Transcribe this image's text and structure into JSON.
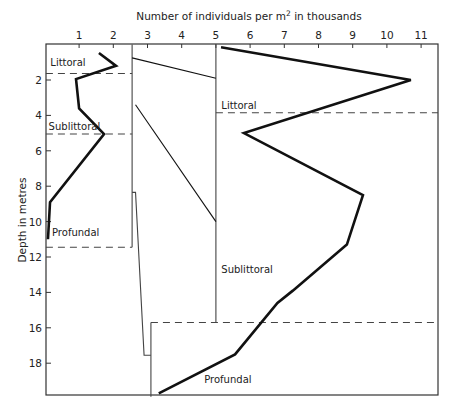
{
  "chart_data": {
    "type": "line",
    "title": "",
    "xlabel": "Number of individuals per m² in thousands",
    "xlabel_parts": {
      "before": "Number of individuals per m",
      "sup": "2",
      "after": " in thousands"
    },
    "ylabel": "Depth in metres",
    "x_ticks": [
      1,
      2,
      3,
      4,
      5,
      6,
      7,
      8,
      9,
      10,
      11
    ],
    "y_ticks": [
      2,
      4,
      6,
      8,
      10,
      12,
      14,
      16,
      18
    ],
    "xlim": [
      0,
      11.5
    ],
    "ylim": [
      0,
      19.9
    ],
    "y_inverted": true,
    "x_axis_position": "top",
    "grid": false,
    "series": [
      {
        "name": "Lake A",
        "style": "thick",
        "points": [
          [
            1.58,
            0.47
          ],
          [
            2.08,
            1.2
          ],
          [
            0.91,
            1.95
          ],
          [
            1.0,
            3.6
          ],
          [
            1.73,
            5.05
          ],
          [
            0.15,
            8.9
          ],
          [
            0.09,
            11.0
          ]
        ]
      },
      {
        "name": "Lake B",
        "style": "thick",
        "points": [
          [
            5.15,
            0.15
          ],
          [
            10.7,
            2.0
          ],
          [
            5.82,
            5.0
          ],
          [
            9.3,
            8.5
          ],
          [
            8.83,
            11.3
          ],
          [
            7.25,
            13.9
          ],
          [
            6.8,
            14.6
          ],
          [
            5.56,
            17.5
          ],
          [
            3.33,
            19.7
          ]
        ]
      },
      {
        "name": "Connector littoral",
        "style": "thin",
        "points": [
          [
            2.55,
            0.75
          ],
          [
            5.0,
            1.9
          ]
        ]
      },
      {
        "name": "Connector sublittoral",
        "style": "thin",
        "points": [
          [
            2.65,
            3.4
          ],
          [
            5.0,
            10.0
          ]
        ]
      }
    ],
    "zone_boundaries": [
      {
        "panel": "left",
        "depth": 1.63,
        "x_from": 0,
        "x_to": 2.55
      },
      {
        "panel": "left",
        "depth": 5.05,
        "x_from": 0,
        "x_to": 2.55
      },
      {
        "panel": "left",
        "depth": 11.45,
        "x_from": 0,
        "x_to": 2.55
      },
      {
        "panel": "right",
        "depth": 3.85,
        "x_from": 5.0,
        "x_to": 11.5
      },
      {
        "panel": "right",
        "depth": 15.7,
        "x_from": 3.1,
        "x_to": 11.5
      }
    ],
    "panel_lines": [
      {
        "name": "left-panel-right-edge",
        "points": [
          [
            2.55,
            0
          ],
          [
            2.55,
            11.45
          ]
        ]
      },
      {
        "name": "middle-step",
        "points": [
          [
            2.55,
            8.35
          ],
          [
            2.65,
            8.35
          ],
          [
            2.9,
            17.55
          ],
          [
            3.1,
            17.55
          ]
        ]
      },
      {
        "name": "profundal-left-edge",
        "points": [
          [
            3.1,
            15.7
          ],
          [
            3.1,
            19.9
          ]
        ]
      },
      {
        "name": "right-panel-left-edge",
        "points": [
          [
            5.0,
            0
          ],
          [
            5.0,
            15.7
          ]
        ]
      }
    ],
    "annotations": [
      {
        "text": "Littoral",
        "x": 0.1,
        "y": 1.0
      },
      {
        "text": "Sublittoral",
        "x": 0.05,
        "y": 4.6
      },
      {
        "text": "Profundal",
        "x": 0.15,
        "y": 10.6
      },
      {
        "text": "Littoral",
        "x": 5.1,
        "y": 3.4
      },
      {
        "text": "Sublittoral",
        "x": 5.1,
        "y": 12.7
      },
      {
        "text": "Profundal",
        "x": 4.6,
        "y": 18.9
      }
    ]
  }
}
